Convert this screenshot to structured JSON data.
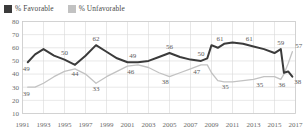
{
  "legend": {
    "position": "top-left",
    "items": [
      {
        "label": "% Favorable",
        "color": "#3b3b3b",
        "name": "favorable"
      },
      {
        "label": "% Unfavorable",
        "color": "#c2c2c2",
        "name": "unfavorable"
      }
    ]
  },
  "chart_data": {
    "type": "line",
    "title": "",
    "subtitle": "",
    "xlabel": "",
    "ylabel": "",
    "xlim": [
      1991,
      2017
    ],
    "ylim": [
      10,
      80
    ],
    "ytick_step": 10,
    "yticks": [
      80,
      70,
      60,
      50,
      40,
      30,
      20,
      10
    ],
    "xticks": [
      1991,
      1993,
      1995,
      1997,
      1999,
      2001,
      2003,
      2005,
      2007,
      2009,
      2011,
      2013,
      2015,
      2017
    ],
    "grid": true,
    "grid_color": "#d8d8d8",
    "legend_position": "top-left",
    "x": [
      1991.5,
      1992.2,
      1993.0,
      1994.0,
      1995.0,
      1996.0,
      1997.0,
      1998.0,
      1999.0,
      2000.0,
      2001.0,
      2002.0,
      2003.0,
      2004.0,
      2005.0,
      2006.0,
      2007.0,
      2008.0,
      2008.6,
      2009.0,
      2009.6,
      2010.2,
      2011.0,
      2012.0,
      2013.0,
      2014.0,
      2015.0,
      2015.6,
      2015.9,
      2016.3,
      2016.7
    ],
    "series": [
      {
        "name": "% Favorable",
        "color": "#3b3b3b",
        "values": [
          49,
          55,
          59,
          54,
          51,
          47,
          54,
          62,
          57,
          52,
          49,
          49,
          50,
          53,
          56,
          53,
          51,
          50,
          52,
          62,
          60,
          63,
          64,
          63,
          61,
          59,
          56,
          59,
          41,
          42,
          38
        ]
      },
      {
        "name": "% Unfavorable",
        "color": "#c2c2c2",
        "values": [
          30,
          30,
          33,
          38,
          42,
          44,
          40,
          33,
          38,
          42,
          46,
          47,
          45,
          41,
          38,
          41,
          44,
          47,
          47,
          41,
          35,
          34,
          34,
          35,
          36,
          38,
          38,
          36,
          40,
          48,
          57
        ]
      }
    ],
    "point_labels": [
      {
        "series": "% Favorable",
        "x": 1991.5,
        "value": 49,
        "text": "49",
        "anchor": "below-left"
      },
      {
        "series": "% Favorable",
        "x": 1995.0,
        "value": 51,
        "text": "50",
        "anchor": "above"
      },
      {
        "series": "% Favorable",
        "x": 1998.0,
        "value": 62,
        "text": "62",
        "anchor": "above"
      },
      {
        "series": "% Favorable",
        "x": 2001.5,
        "value": 49,
        "text": "49",
        "anchor": "above"
      },
      {
        "series": "% Favorable",
        "x": 2005.0,
        "value": 56,
        "text": "56",
        "anchor": "above"
      },
      {
        "series": "% Favorable",
        "x": 2008.0,
        "value": 50,
        "text": "50",
        "anchor": "above"
      },
      {
        "series": "% Favorable",
        "x": 2009.8,
        "value": 62,
        "text": "61",
        "anchor": "above"
      },
      {
        "series": "% Favorable",
        "x": 2012.6,
        "value": 62,
        "text": "61",
        "anchor": "above"
      },
      {
        "series": "% Favorable",
        "x": 2015.6,
        "value": 59,
        "text": "59",
        "anchor": "above"
      },
      {
        "series": "% Favorable",
        "x": 2016.7,
        "value": 38,
        "text": "38",
        "anchor": "below-right"
      },
      {
        "series": "% Unfavorable",
        "x": 1991.5,
        "value": 30,
        "text": "39",
        "anchor": "below-left"
      },
      {
        "series": "% Unfavorable",
        "x": 1996.0,
        "value": 44,
        "text": "44",
        "anchor": "below"
      },
      {
        "series": "% Unfavorable",
        "x": 1998.0,
        "value": 33,
        "text": "33",
        "anchor": "below"
      },
      {
        "series": "% Unfavorable",
        "x": 2001.3,
        "value": 46,
        "text": "46",
        "anchor": "below"
      },
      {
        "series": "% Unfavorable",
        "x": 2004.6,
        "value": 38,
        "text": "38",
        "anchor": "below"
      },
      {
        "series": "% Unfavorable",
        "x": 2007.6,
        "value": 46,
        "text": "47",
        "anchor": "below"
      },
      {
        "series": "% Unfavorable",
        "x": 2010.3,
        "value": 34,
        "text": "35",
        "anchor": "below"
      },
      {
        "series": "% Unfavorable",
        "x": 2013.6,
        "value": 36,
        "text": "35",
        "anchor": "below"
      },
      {
        "series": "% Unfavorable",
        "x": 2015.7,
        "value": 36,
        "text": "36",
        "anchor": "below"
      },
      {
        "series": "% Unfavorable",
        "x": 2016.7,
        "value": 57,
        "text": "57",
        "anchor": "above-right"
      }
    ]
  }
}
